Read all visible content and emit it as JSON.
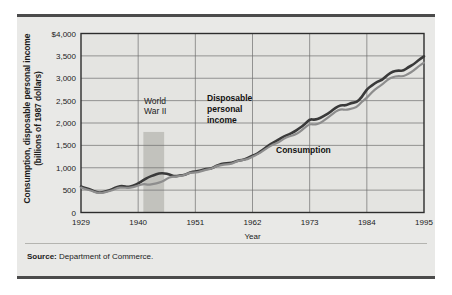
{
  "figure": {
    "background_color": "#e9e9e7",
    "rule_color": "#4b4b4b",
    "source_prefix": "Source:",
    "source_text": "Department of Commerce."
  },
  "chart_data": {
    "type": "line",
    "title": "",
    "xlabel": "Year",
    "ylabel": "Consumption, disposable personal income (billions of 1987 dollars)",
    "ylabel_line1": "Consumption, disposable personal income",
    "ylabel_line2": "(billions of 1987 dollars)",
    "xlim": [
      1929,
      1995
    ],
    "ylim": [
      0,
      4000
    ],
    "grid": true,
    "legend_position": "inline-annotations",
    "y_ticks": [
      0,
      500,
      1000,
      1500,
      2000,
      2500,
      3000,
      3500,
      4000
    ],
    "y_tick_labels": [
      "0",
      "500",
      "1,000",
      "1,500",
      "2,000",
      "2,500",
      "3,000",
      "3,500",
      "$4,000"
    ],
    "x_ticks": [
      1929,
      1940,
      1951,
      1962,
      1973,
      1984,
      1995
    ],
    "x_tick_labels": [
      "1929",
      "1940",
      "1951",
      "1962",
      "1973",
      "1984",
      "1995"
    ],
    "x": [
      1929,
      1930,
      1931,
      1932,
      1933,
      1934,
      1935,
      1936,
      1937,
      1938,
      1939,
      1940,
      1941,
      1942,
      1943,
      1944,
      1945,
      1946,
      1947,
      1948,
      1949,
      1950,
      1951,
      1952,
      1953,
      1954,
      1955,
      1956,
      1957,
      1958,
      1959,
      1960,
      1961,
      1962,
      1963,
      1964,
      1965,
      1966,
      1967,
      1968,
      1969,
      1970,
      1971,
      1972,
      1973,
      1974,
      1975,
      1976,
      1977,
      1978,
      1979,
      1980,
      1981,
      1982,
      1983,
      1984,
      1985,
      1986,
      1987,
      1988,
      1989,
      1990,
      1991,
      1992,
      1993,
      1994,
      1995
    ],
    "series": [
      {
        "name": "Disposable personal income",
        "color": "#3a3a3a",
        "width": 2.6,
        "values": [
          580,
          540,
          505,
          450,
          445,
          480,
          515,
          580,
          595,
          565,
          600,
          645,
          720,
          790,
          835,
          875,
          880,
          850,
          805,
          830,
          835,
          900,
          915,
          940,
          975,
          980,
          1040,
          1085,
          1105,
          1105,
          1155,
          1175,
          1210,
          1270,
          1315,
          1405,
          1490,
          1565,
          1625,
          1700,
          1740,
          1805,
          1880,
          1965,
          2090,
          2070,
          2105,
          2175,
          2245,
          2345,
          2400,
          2390,
          2450,
          2460,
          2570,
          2760,
          2840,
          2925,
          2965,
          3080,
          3150,
          3175,
          3160,
          3250,
          3310,
          3410,
          3490
        ],
        "label_lines": [
          "Disposable",
          "personal",
          "income"
        ],
        "label_x": 207,
        "label_y": 101
      },
      {
        "name": "Consumption",
        "color": "#8d8d8d",
        "width": 2.2,
        "values": [
          555,
          515,
          490,
          440,
          435,
          465,
          495,
          550,
          560,
          545,
          570,
          600,
          640,
          620,
          640,
          665,
          710,
          790,
          800,
          815,
          840,
          895,
          890,
          915,
          955,
          970,
          1035,
          1060,
          1080,
          1085,
          1145,
          1170,
          1190,
          1250,
          1300,
          1375,
          1455,
          1525,
          1560,
          1650,
          1700,
          1730,
          1790,
          1890,
          1980,
          1960,
          1995,
          2080,
          2165,
          2255,
          2310,
          2290,
          2320,
          2350,
          2470,
          2560,
          2690,
          2790,
          2860,
          2970,
          3030,
          3050,
          3040,
          3100,
          3170,
          3270,
          3350
        ],
        "label": "Consumption",
        "label_x": 276,
        "label_y": 153
      }
    ],
    "annotations": [
      {
        "name": "world-war-ii",
        "lines": [
          "World",
          "War II"
        ],
        "x": 144,
        "y": 104,
        "band": {
          "start_year": 1941,
          "end_year": 1945,
          "color": "#c2c2bd",
          "top_value": 1800
        }
      }
    ]
  }
}
